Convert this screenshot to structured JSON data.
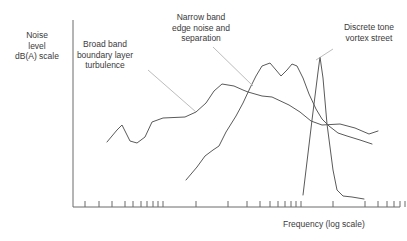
{
  "figure": {
    "background": "#ffffff",
    "line_color": "#5a5a5a",
    "axis_color": "#6b6b6b",
    "leader_color": "#b4b4b4"
  },
  "axes": {
    "y_label": "Noise\nlevel\ndB(A) scale",
    "x_label": "Frequency (log scale)"
  },
  "annotations": {
    "broadband": "Broad band\nboundary layer\nturbulence",
    "narrowband": "Narrow band\nedge noise and\nseparation",
    "discrete": "Discrete tone\nvortex street"
  },
  "chart_data": {
    "type": "line",
    "title": "",
    "xlabel": "Frequency (log scale)",
    "ylabel": "Noise level dB(A) scale",
    "xscale": "log",
    "grid": false,
    "legend": "none",
    "axis_ticks_labeled": false,
    "annotations": [
      {
        "text": "Broad band boundary layer turbulence",
        "points_to_series": "broadband-boundary-layer-turbulence"
      },
      {
        "text": "Narrow band edge noise and separation",
        "points_to_series": "narrowband-edge-noise-separation"
      },
      {
        "text": "Discrete tone vortex street",
        "points_to_series": "discrete-tone-vortex-street"
      }
    ],
    "series": [
      {
        "name": "broadband-boundary-layer-turbulence",
        "points": [
          [
            107,
            142
          ],
          [
            117,
            130
          ],
          [
            122,
            125
          ],
          [
            130,
            141
          ],
          [
            137,
            143
          ],
          [
            145,
            137
          ],
          [
            152,
            122
          ],
          [
            163,
            118
          ],
          [
            185,
            117
          ],
          [
            196,
            112
          ],
          [
            206,
            103
          ],
          [
            214,
            91
          ],
          [
            222,
            84
          ],
          [
            234,
            86
          ],
          [
            243,
            90
          ],
          [
            248,
            92
          ],
          [
            262,
            96
          ],
          [
            272,
            97
          ],
          [
            289,
            105
          ],
          [
            300,
            112
          ],
          [
            311,
            121
          ],
          [
            322,
            125
          ],
          [
            340,
            124
          ],
          [
            355,
            128
          ],
          [
            369,
            134
          ],
          [
            378,
            131
          ]
        ]
      },
      {
        "name": "narrowband-edge-noise-separation",
        "points": [
          [
            186,
            180
          ],
          [
            197,
            167
          ],
          [
            205,
            156
          ],
          [
            213,
            150
          ],
          [
            219,
            146
          ],
          [
            226,
            132
          ],
          [
            236,
            116
          ],
          [
            243,
            103
          ],
          [
            250,
            88
          ],
          [
            256,
            76
          ],
          [
            262,
            66
          ],
          [
            270,
            63
          ],
          [
            276,
            70
          ],
          [
            281,
            76
          ],
          [
            287,
            70
          ],
          [
            292,
            64
          ],
          [
            297,
            66
          ],
          [
            303,
            78
          ],
          [
            309,
            94
          ],
          [
            316,
            109
          ],
          [
            322,
            119
          ],
          [
            329,
            126
          ],
          [
            338,
            133
          ],
          [
            347,
            136
          ],
          [
            360,
            140
          ],
          [
            372,
            144
          ]
        ]
      },
      {
        "name": "discrete-tone-vortex-street",
        "points": [
          [
            303,
            195
          ],
          [
            312,
            120
          ],
          [
            318,
            72
          ],
          [
            320,
            57
          ],
          [
            323,
            78
          ],
          [
            327,
            124
          ],
          [
            333,
            170
          ],
          [
            337,
            190
          ],
          [
            343,
            196
          ],
          [
            352,
            197
          ],
          [
            364,
            199
          ]
        ]
      }
    ],
    "x_ticks_px": [
      85,
      99,
      112,
      125,
      133,
      141,
      147,
      153,
      158,
      163,
      196,
      228,
      247,
      260,
      270,
      278,
      285,
      291,
      296,
      301,
      333,
      365,
      378,
      387,
      394,
      400,
      405
    ],
    "axis_box_px": {
      "x_left": 73,
      "y_top": 20,
      "y_bottom": 207,
      "x_right": 400
    }
  }
}
